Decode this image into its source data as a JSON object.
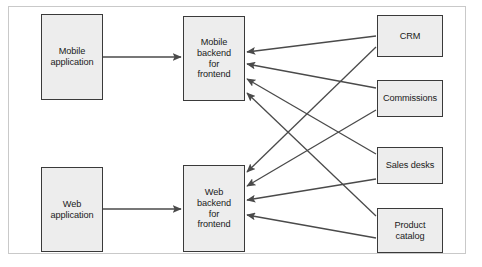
{
  "diagram": {
    "type": "architecture-block-diagram",
    "frame": {
      "stroke": "#c9c9c9",
      "fill": "#ffffff"
    },
    "style": {
      "node_fill": "#ededed",
      "node_stroke": "#3a3a3a",
      "edge_stroke": "#4a4a4a",
      "text_color": "#1a1a1a"
    },
    "nodes": [
      {
        "id": "mobile-application",
        "label": "Mobile\napplication",
        "column": "clients",
        "x": 41,
        "y": 14,
        "w": 62,
        "h": 86
      },
      {
        "id": "mobile-bff",
        "label": "Mobile\nbackend\nfor\nfrontend",
        "column": "bff",
        "x": 183,
        "y": 16,
        "w": 62,
        "h": 85
      },
      {
        "id": "web-application",
        "label": "Web\napplication",
        "column": "clients",
        "x": 41,
        "y": 167,
        "w": 62,
        "h": 85
      },
      {
        "id": "web-bff",
        "label": "Web\nbackend\nfor\nfrontend",
        "column": "bff",
        "x": 183,
        "y": 165,
        "w": 62,
        "h": 87
      },
      {
        "id": "crm",
        "label": "CRM",
        "column": "services",
        "x": 377,
        "y": 15,
        "w": 66,
        "h": 42
      },
      {
        "id": "commissions",
        "label": "Commissions",
        "column": "services",
        "x": 377,
        "y": 80,
        "w": 66,
        "h": 37
      },
      {
        "id": "sales-desks",
        "label": "Sales desks",
        "column": "services",
        "x": 377,
        "y": 147,
        "w": 66,
        "h": 37
      },
      {
        "id": "product-catalog",
        "label": "Product\ncatalog",
        "column": "services",
        "x": 377,
        "y": 208,
        "w": 66,
        "h": 45
      }
    ],
    "edges": [
      {
        "id": "edge-mobile-app-to-mobile-bff",
        "from": "mobile-application",
        "to": "mobile-bff",
        "x1": 103,
        "y1": 57,
        "x2": 181,
        "y2": 57,
        "arrow": "end"
      },
      {
        "id": "edge-web-app-to-web-bff",
        "from": "web-application",
        "to": "web-bff",
        "x1": 103,
        "y1": 209,
        "x2": 181,
        "y2": 209,
        "arrow": "end"
      },
      {
        "id": "edge-crm-to-mobile-bff",
        "from": "crm",
        "to": "mobile-bff",
        "x1": 376,
        "y1": 36,
        "x2": 247,
        "y2": 52,
        "arrow": "end"
      },
      {
        "id": "edge-crm-to-web-bff",
        "from": "crm",
        "to": "web-bff",
        "x1": 376,
        "y1": 47,
        "x2": 247,
        "y2": 172,
        "arrow": "end"
      },
      {
        "id": "edge-commissions-to-mobile-bff",
        "from": "commissions",
        "to": "mobile-bff",
        "x1": 376,
        "y1": 88,
        "x2": 247,
        "y2": 64,
        "arrow": "end"
      },
      {
        "id": "edge-commissions-to-web-bff",
        "from": "commissions",
        "to": "web-bff",
        "x1": 376,
        "y1": 110,
        "x2": 247,
        "y2": 186,
        "arrow": "end"
      },
      {
        "id": "edge-sales-desks-to-mobile-bff",
        "from": "sales-desks",
        "to": "mobile-bff",
        "x1": 376,
        "y1": 154,
        "x2": 247,
        "y2": 79,
        "arrow": "end"
      },
      {
        "id": "edge-sales-desks-to-web-bff",
        "from": "sales-desks",
        "to": "web-bff",
        "x1": 376,
        "y1": 179,
        "x2": 247,
        "y2": 200,
        "arrow": "end"
      },
      {
        "id": "edge-product-catalog-to-mobile-bff",
        "from": "product-catalog",
        "to": "mobile-bff",
        "x1": 376,
        "y1": 216,
        "x2": 247,
        "y2": 93,
        "arrow": "end"
      },
      {
        "id": "edge-product-catalog-to-web-bff",
        "from": "product-catalog",
        "to": "web-bff",
        "x1": 376,
        "y1": 238,
        "x2": 247,
        "y2": 215,
        "arrow": "end"
      }
    ]
  }
}
